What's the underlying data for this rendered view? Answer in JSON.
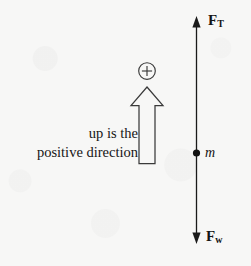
{
  "diagram": {
    "background_color": "#f7f7f6",
    "ink_color": "#141414",
    "caption": {
      "line1": "up is the",
      "line2": "positive direction"
    },
    "labels": {
      "tension_symbol": "F",
      "tension_subscript": "T",
      "weight_symbol": "F",
      "weight_subscript": "w",
      "mass": "m",
      "sign_convention": "+"
    },
    "elements": [
      {
        "name": "force-axis-line",
        "type": "double-headed-arrow",
        "orientation": "vertical"
      },
      {
        "name": "mass-point",
        "type": "filled-dot"
      },
      {
        "name": "positive-direction-arrow",
        "type": "outlined-block-arrow",
        "direction": "up"
      },
      {
        "name": "plus-sign-circle",
        "type": "circled-glyph"
      }
    ]
  }
}
